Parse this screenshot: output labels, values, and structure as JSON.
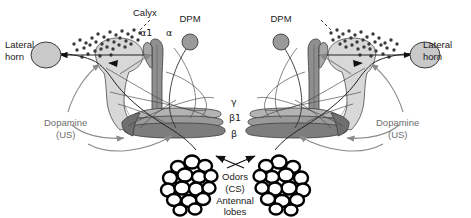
{
  "figure": {
    "background": "#ffffff",
    "width": 471,
    "height": 218
  },
  "colors": {
    "outline": "#1a1a1a",
    "text": "#1a1a1a",
    "text_gray": "#6e6e6e",
    "calyx_fill": "#d8d8d8",
    "alpha_lobe_fill": "#8f8f8f",
    "beta_lobe_fill": "#7d7d7d",
    "gamma_lobe_fill": "#b3b3b3",
    "dpm_fill": "#9a9a9a",
    "lateral_horn_fill": "#c9c9c9",
    "kenyon_dot": "#3a3a3a",
    "dopamine_arrow": "#8a8a8a",
    "glomerulus_fill": "#ffffff",
    "glomerulus_stroke": "#000000"
  },
  "labels": {
    "calyx": "Calyx",
    "alpha1": "α1",
    "alpha": "α",
    "gamma": "γ",
    "beta1": "β1",
    "beta": "β",
    "dpm_left": "DPM",
    "dpm_right": "DPM",
    "lateral_horn_left_line1": "Lateral",
    "lateral_horn_left_line2": "horn",
    "lateral_horn_right_line1": "Lateral",
    "lateral_horn_right_line2": "horn",
    "dopamine_left_line1": "Dopamine",
    "dopamine_left_line2": "(US)",
    "dopamine_right_line1": "Dopamine",
    "dopamine_right_line2": "(US)",
    "odors_line1": "Odors",
    "odors_line2": "(CS)",
    "odors_line3": "Antennal",
    "odors_line4": "lobes"
  },
  "structures": [
    {
      "name": "calyx",
      "side": "left",
      "description": "Mushroom body calyx, light gray lobed region with Kenyon cell body dots above"
    },
    {
      "name": "calyx",
      "side": "right",
      "description": "Mushroom body calyx, mirrored"
    },
    {
      "name": "alpha-lobe",
      "side": "left",
      "description": "Vertical dark gray alpha lobe with alpha1 branch"
    },
    {
      "name": "alpha-lobe",
      "side": "right",
      "description": "Vertical dark gray alpha lobe, mirrored"
    },
    {
      "name": "beta-gamma-lobes",
      "side": "left",
      "description": "Horizontal medial lobes labelled gamma, beta1, beta"
    },
    {
      "name": "beta-gamma-lobes",
      "side": "right",
      "description": "Horizontal medial lobes, mirrored"
    },
    {
      "name": "dpm-neuron",
      "side": "left",
      "description": "Dorsal paired medial neuron soma, gray circle with projecting process"
    },
    {
      "name": "dpm-neuron",
      "side": "right",
      "description": "Dorsal paired medial neuron soma, mirrored"
    },
    {
      "name": "lateral-horn",
      "side": "left",
      "description": "Lateral horn, gray ellipse receiving projection neuron input"
    },
    {
      "name": "lateral-horn",
      "side": "right",
      "description": "Lateral horn, mirrored"
    },
    {
      "name": "antennal-lobe",
      "side": "left",
      "description": "Antennal lobe, cluster of white glomeruli with black outlines"
    },
    {
      "name": "antennal-lobe",
      "side": "right",
      "description": "Antennal lobe, mirrored"
    }
  ],
  "pathways": [
    {
      "name": "projection-neuron-to-lateral-horn",
      "from": "antennal-lobe",
      "to": "lateral-horn",
      "style": "solid black arrow"
    },
    {
      "name": "projection-neuron-to-calyx",
      "from": "antennal-lobe",
      "to": "calyx",
      "style": "solid black"
    },
    {
      "name": "dopaminergic-input",
      "from": "dopamine-US",
      "to": "mushroom-body-lobes",
      "style": "gray curved arrow"
    },
    {
      "name": "dpm-innervation",
      "from": "dpm-neuron",
      "to": "mushroom-body-lobes",
      "style": "thin black curve"
    },
    {
      "name": "odor-input",
      "from": "odors-CS",
      "to": "antennal-lobe",
      "style": "black arrow"
    }
  ]
}
